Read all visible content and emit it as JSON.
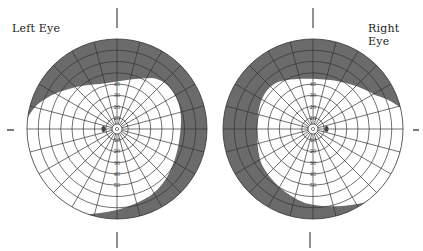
{
  "labels": {
    "left": "Left Eye",
    "right": "Right Eye"
  },
  "scale_labels": [
    "10",
    "20",
    "30",
    "40",
    "50",
    "60",
    "70",
    "80"
  ],
  "colors": {
    "defect": "#6b6b6b",
    "grid": "#333333",
    "background": "#ffffff"
  },
  "charts": [
    {
      "eye": "left",
      "center": [
        117,
        129
      ],
      "radius": 90,
      "defect": "Superior and temporal-right field loss (shaded periphery), spanning top arc and right/lower-right sector",
      "blind_spot_side": "left"
    },
    {
      "eye": "right",
      "center": [
        313,
        129
      ],
      "radius": 90,
      "defect": "Superior and left/lower-left field loss (shaded periphery)",
      "blind_spot_side": "right"
    }
  ]
}
